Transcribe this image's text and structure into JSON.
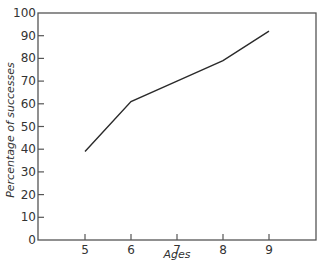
{
  "chart_data": {
    "type": "line",
    "title": "",
    "xlabel": "Ages",
    "ylabel": "Percentage of successes",
    "x": [
      5,
      6,
      7,
      8,
      9
    ],
    "categories": [
      "5",
      "6",
      "7",
      "8",
      "9"
    ],
    "series": [
      {
        "name": "Percentage of successes",
        "values": [
          39,
          61,
          70,
          79,
          92
        ]
      }
    ],
    "xlim": [
      4,
      10
    ],
    "ylim": [
      0,
      100
    ],
    "yticks": [
      0,
      10,
      20,
      30,
      40,
      50,
      60,
      70,
      80,
      90,
      100
    ],
    "xticks": [
      5,
      6,
      7,
      8,
      9
    ],
    "grid": false,
    "legend": "none"
  },
  "colors": {
    "line": "#2a2a2a",
    "frame": "#555555",
    "text": "#333333"
  }
}
